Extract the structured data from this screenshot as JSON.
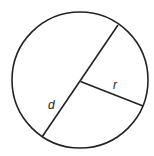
{
  "diagram": {
    "title": "",
    "shape": "circle",
    "labels": {
      "diameter": "d",
      "radius": "r"
    },
    "colors": {
      "stroke": "#222222",
      "background": "#ffffff"
    }
  }
}
